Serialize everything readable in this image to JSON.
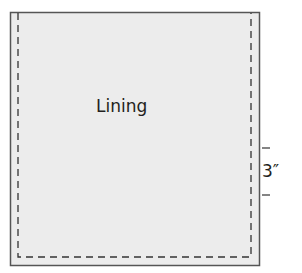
{
  "diagram": {
    "panel_label": "Lining",
    "dimension_label": "3″",
    "colors": {
      "panel_fill": "#ececec",
      "outline": "#555555",
      "seam_line": "#333333",
      "text": "#231f20"
    }
  }
}
